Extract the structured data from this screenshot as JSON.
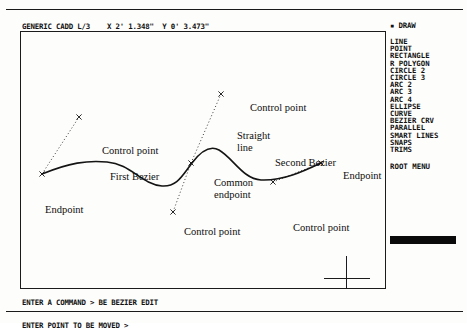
{
  "app": {
    "title": "GENERIC CADD L/3",
    "coordinate_x": "X 2' 1.348\"",
    "coordinate_y": "Y 0' 3.473\""
  },
  "status_bar": {
    "text": "GENERIC CADD L/3    X 2' 1.348\"  Y 0' 3.473\""
  },
  "menu": {
    "title": "▪ DRAW",
    "items": [
      {
        "label": "LINE"
      },
      {
        "label": "POINT"
      },
      {
        "label": "RECTANGLE"
      },
      {
        "label": "R POLYGON"
      },
      {
        "label": "CIRCLE 2"
      },
      {
        "label": "CIRCLE 3"
      },
      {
        "label": "ARC 2"
      },
      {
        "label": "ARC 3"
      },
      {
        "label": "ARC 4"
      },
      {
        "label": "ELLIPSE"
      },
      {
        "label": "CURVE"
      },
      {
        "label": "BEZIER CRV"
      },
      {
        "label": "PARALLEL"
      },
      {
        "label": "SMART LINES"
      },
      {
        "label": "SNAPS"
      },
      {
        "label": "TRIMS"
      }
    ],
    "root_label": "ROOT MENU"
  },
  "command": {
    "line1": "ENTER A COMMAND > BE BEZIER EDIT",
    "line2": "ENTER POINT TO BE MOVED >"
  },
  "annotations": [
    {
      "id": "control-point-1",
      "text": "Control point",
      "x": 81,
      "y": 113
    },
    {
      "id": "first-bezier",
      "text": "First Bezier",
      "x": 89,
      "y": 139
    },
    {
      "id": "endpoint-left",
      "text": "Endpoint",
      "x": 24,
      "y": 172
    },
    {
      "id": "control-point-2",
      "text": "Control point",
      "x": 229,
      "y": 70
    },
    {
      "id": "straight-line-1",
      "text": "Straight",
      "x": 216,
      "y": 98
    },
    {
      "id": "straight-line-2",
      "text": "line",
      "x": 216,
      "y": 110
    },
    {
      "id": "common-endpoint-1",
      "text": "Common",
      "x": 193,
      "y": 145
    },
    {
      "id": "common-endpoint-2",
      "text": "endpoint",
      "x": 193,
      "y": 157
    },
    {
      "id": "second-bezier",
      "text": "Second Bezier",
      "x": 254,
      "y": 125
    },
    {
      "id": "endpoint-right",
      "text": "Endpoint",
      "x": 322,
      "y": 138
    },
    {
      "id": "control-point-3",
      "text": "Control point",
      "x": 163,
      "y": 194
    },
    {
      "id": "control-point-4",
      "text": "Control point",
      "x": 272,
      "y": 190
    }
  ],
  "geometry": {
    "curve_color": "#141414",
    "tangent_color": "#3a3a3a",
    "bezier_path": "M 21 142 C 48 131 66 128 86 130 C 110 132 120 152 141 154 C 156 155 161 144 171 131 C 180 119 189 113 198 118 C 212 126 222 147 240 148 C 262 149 283 139 300 131",
    "tangents": [
      {
        "id": "tangent-1",
        "x1": 21,
        "y1": 142,
        "x2": 58,
        "y2": 85
      },
      {
        "id": "tangent-2",
        "x1": 170,
        "y1": 131,
        "x2": 200,
        "y2": 62
      },
      {
        "id": "tangent-3",
        "x1": 170,
        "y1": 131,
        "x2": 152,
        "y2": 180
      },
      {
        "id": "tangent-4",
        "x1": 300,
        "y1": 131,
        "x2": 252,
        "y2": 150
      }
    ],
    "markers": [
      {
        "id": "marker-endpoint-left",
        "x": 21,
        "y": 142
      },
      {
        "id": "marker-control-1",
        "x": 58,
        "y": 85
      },
      {
        "id": "marker-common-endpoint",
        "x": 170,
        "y": 131
      },
      {
        "id": "marker-control-2",
        "x": 200,
        "y": 62
      },
      {
        "id": "marker-control-3",
        "x": 152,
        "y": 180
      },
      {
        "id": "marker-control-4",
        "x": 252,
        "y": 150
      },
      {
        "id": "marker-endpoint-right",
        "x": 300,
        "y": 131
      }
    ]
  },
  "cursor": {
    "name": "crosshair",
    "x": 303,
    "y": 224
  }
}
